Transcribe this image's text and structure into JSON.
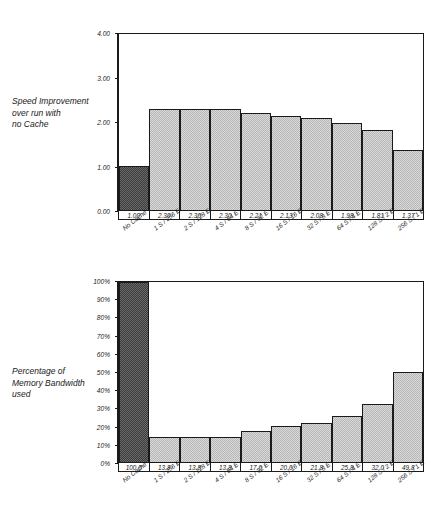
{
  "figure": {
    "top_caption": [
      "Speed Improvement",
      "over run with",
      "no Cache"
    ],
    "bottom_caption": [
      "Percentage of",
      "Memory Bandwidth",
      "used"
    ]
  },
  "chart_data": [
    {
      "type": "bar",
      "title": "Speed Improvement over run with no Cache",
      "xlabel": "",
      "ylabel": "Speed Improvement over run with no Cache",
      "ylim": [
        0,
        4
      ],
      "yticks": [
        "0.00",
        "1.00",
        "2.00",
        "3.00",
        "4.00"
      ],
      "ytick_values": [
        0,
        1,
        2,
        3,
        4
      ],
      "grid": false,
      "legend": "none",
      "categories": [
        "No Cache",
        "1 S / 256 E",
        "2 S / 128 E",
        "4 S / 64 E",
        "8 S / 32 E",
        "16 S / 16 E",
        "32 S / 8 E",
        "64 S / 4 E",
        "128 S / 2 E",
        "256 S / 1 E"
      ],
      "values": [
        1.0,
        2.3,
        2.3,
        2.3,
        2.21,
        2.13,
        2.08,
        1.98,
        1.81,
        1.37
      ],
      "data_labels": [
        "1.00",
        "2.30",
        "2.30",
        "2.30",
        "2.21",
        "2.13",
        "2.08",
        "1.98",
        "1.81",
        "1.37"
      ],
      "bar_styles": [
        "dark",
        "light",
        "light",
        "light",
        "light",
        "light",
        "light",
        "light",
        "light",
        "light"
      ]
    },
    {
      "type": "bar",
      "title": "Percentage of Memory Bandwidth used",
      "xlabel": "",
      "ylabel": "Percentage of Memory Bandwidth used",
      "ylim": [
        0,
        100
      ],
      "yticks": [
        "0%",
        "10%",
        "20%",
        "30%",
        "40%",
        "50%",
        "60%",
        "70%",
        "80%",
        "90%",
        "100%"
      ],
      "ytick_values": [
        0,
        10,
        20,
        30,
        40,
        50,
        60,
        70,
        80,
        90,
        100
      ],
      "grid": false,
      "legend": "none",
      "categories": [
        "No Cache",
        "1 S / 256 E",
        "2 S / 128 E",
        "4 S / 64 E",
        "8 S / 32 E",
        "16 S / 16 E",
        "32 S / 8 E",
        "64 S / 4 E",
        "128 S / 2 E",
        "256 S / 1 E"
      ],
      "values": [
        100.0,
        13.8,
        13.8,
        13.8,
        17.0,
        20.0,
        21.8,
        25.8,
        32.0,
        49.8
      ],
      "data_labels": [
        "100.0",
        "13.8",
        "13.8",
        "13.8",
        "17.0",
        "20.0",
        "21.8",
        "25.8",
        "32.0",
        "49.8"
      ],
      "bar_styles": [
        "dark",
        "light",
        "light",
        "light",
        "light",
        "light",
        "light",
        "light",
        "light",
        "light"
      ]
    }
  ]
}
